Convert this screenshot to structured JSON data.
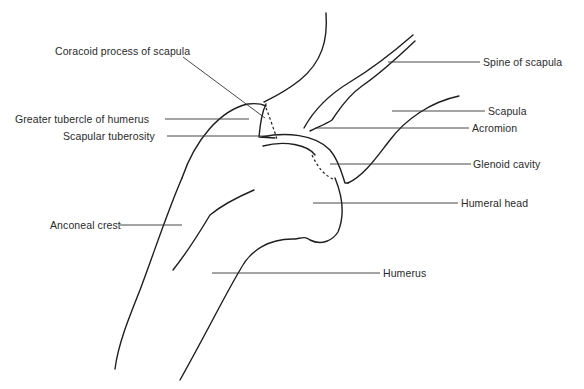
{
  "diagram": {
    "labels": {
      "coracoid": "Coracoid process of scapula",
      "greater_tubercle": "Greater tubercle of humerus",
      "scapular_tuberosity": "Scapular tuberosity",
      "anconeal_crest": "Anconeal crest",
      "spine_of_scapula": "Spine of scapula",
      "scapula": "Scapula",
      "acromion": "Acromion",
      "glenoid_cavity": "Glenoid cavity",
      "humeral_head": "Humeral head",
      "humerus": "Humerus"
    },
    "colors": {
      "line": "#1e1e1e",
      "leader": "#333333",
      "text": "#2a2a2a",
      "background": "#ffffff"
    }
  }
}
